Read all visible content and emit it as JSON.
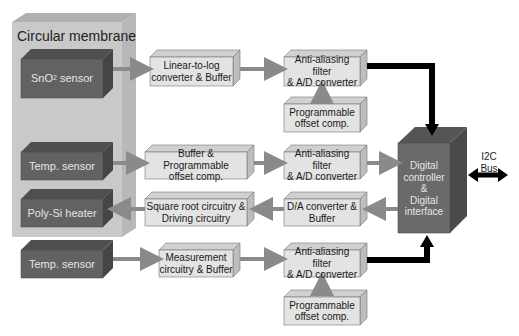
{
  "diagram": {
    "type": "block-diagram",
    "colors": {
      "membrane": "#c9c9c9",
      "sensor_block": "#626262",
      "circuit_block": "#e3e3e3",
      "controller_block": "#6a6a6a",
      "data_arrow": "#000000",
      "signal_arrow": "#8a8a8a"
    },
    "membrane": {
      "label": "Circular membrane"
    },
    "sensors": {
      "sno2": {
        "label": "SnO",
        "subscript": "2",
        "suffix": " sensor"
      },
      "temp1": {
        "label": "Temp. sensor"
      },
      "heater": {
        "label": "Poly-Si heater"
      },
      "temp2": {
        "label": "Temp. sensor"
      }
    },
    "blocks": {
      "lin2log": {
        "line1": "Linear-to-log",
        "line2": "converter & Buffer"
      },
      "adc1": {
        "line1": "Anti-aliasing filter",
        "line2": "& A/D converter"
      },
      "offset1": {
        "line1": "Programmable",
        "line2": "offset comp."
      },
      "buf_prog": {
        "line1": "Buffer & Programmable",
        "line2": "offset comp."
      },
      "adc2": {
        "line1": "Anti-aliasing filter",
        "line2": "& A/D converter"
      },
      "sqrt": {
        "line1": "Square root circuitry &",
        "line2": "Driving circuitry"
      },
      "dac": {
        "line1": "D/A converter &",
        "line2": "Buffer"
      },
      "meas": {
        "line1": "Measurement",
        "line2": "circuitry & Buffer"
      },
      "adc3": {
        "line1": "Anti-aliasing filter",
        "line2": "& A/D converter"
      },
      "offset3": {
        "line1": "Programmable",
        "line2": "offset comp."
      }
    },
    "controller": {
      "line1": "Digital",
      "line2": "controller",
      "line3": "&",
      "line4": "Digital",
      "line5": "interface"
    },
    "bus": {
      "line1": "I2C",
      "line2": "Bus"
    }
  }
}
